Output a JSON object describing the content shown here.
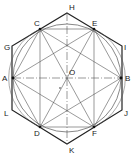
{
  "diagram": {
    "colors": {
      "line": "#222222",
      "thin": "#555555",
      "background": "#ffffff"
    },
    "circle": {
      "center": "O",
      "cx": 67,
      "cy": 78,
      "r": 54
    },
    "points": {
      "H": {
        "label": "H",
        "x": 67,
        "y": 13
      },
      "C": {
        "label": "C",
        "x": 40,
        "y": 29
      },
      "E": {
        "label": "E",
        "x": 94,
        "y": 29
      },
      "G": {
        "label": "G",
        "x": 12,
        "y": 46
      },
      "I": {
        "label": "I",
        "x": 122,
        "y": 46
      },
      "A": {
        "label": "A",
        "x": 13,
        "y": 78
      },
      "O": {
        "label": "O",
        "x": 67,
        "y": 78
      },
      "B": {
        "label": "B",
        "x": 121,
        "y": 78
      },
      "L": {
        "label": "L",
        "x": 12,
        "y": 110
      },
      "J": {
        "label": "J",
        "x": 122,
        "y": 110
      },
      "D": {
        "label": "D",
        "x": 40,
        "y": 127
      },
      "F": {
        "label": "F",
        "x": 94,
        "y": 127
      },
      "K": {
        "label": "K",
        "x": 67,
        "y": 144
      }
    },
    "labels": {
      "H": "H",
      "C": "C",
      "E": "E",
      "G": "G",
      "I": "I",
      "A": "A",
      "O": "O",
      "B": "B",
      "L": "L",
      "J": "J",
      "D": "D",
      "F": "F",
      "K": "K"
    },
    "center_marker": "+"
  }
}
